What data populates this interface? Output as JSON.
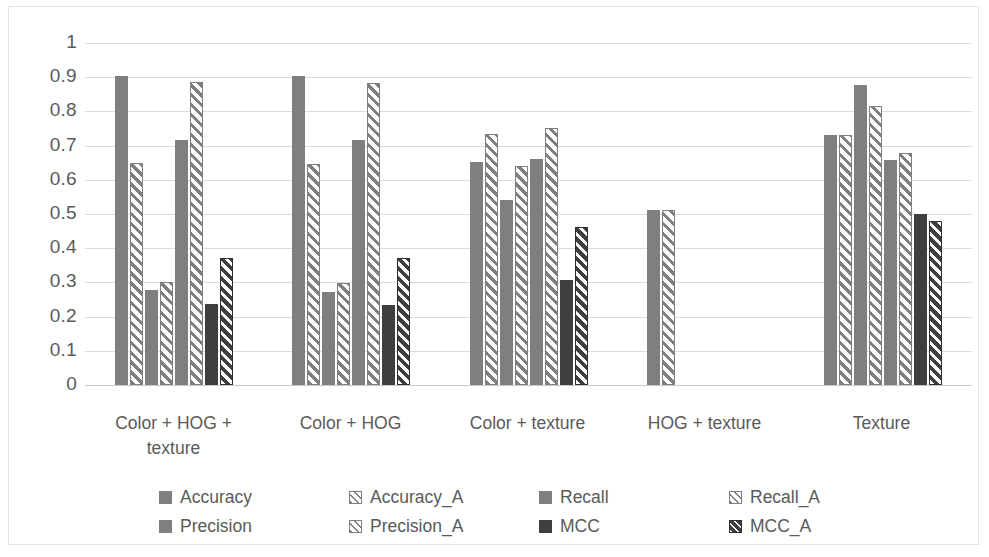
{
  "chart_data": {
    "type": "bar",
    "title": "",
    "xlabel": "",
    "ylabel": "",
    "ylim": [
      0,
      1
    ],
    "ytick_labels": [
      "1",
      "0.9",
      "0.8",
      "0.7",
      "0.6",
      "0.5",
      "0.4",
      "0.3",
      "0.2",
      "0.1",
      "0"
    ],
    "yticks": [
      1,
      0.9,
      0.8,
      0.7,
      0.6,
      0.5,
      0.4,
      0.3,
      0.2,
      0.1,
      0
    ],
    "grid": true,
    "legend_position": "bottom",
    "categories": [
      "Color + HOG + texture",
      "Color + HOG",
      "Color + texture",
      "HOG  + texture",
      "Texture"
    ],
    "category_lines": [
      [
        "Color + HOG +",
        "texture"
      ],
      [
        "Color + HOG"
      ],
      [
        "Color + texture"
      ],
      [
        "HOG  + texture"
      ],
      [
        "Texture"
      ]
    ],
    "series": [
      {
        "name": "Accuracy",
        "style": "solid-gray",
        "values": [
          0.905,
          0.905,
          0.653,
          0.512,
          0.732
        ]
      },
      {
        "name": "Accuracy_A",
        "style": "hatch-gray",
        "values": [
          0.648,
          0.645,
          0.735,
          0.512,
          0.732
        ]
      },
      {
        "name": "Recall",
        "style": "solid-gray",
        "values": [
          0.277,
          0.272,
          0.54,
          null,
          0.877
        ]
      },
      {
        "name": "Recall_A",
        "style": "hatch-gray",
        "values": [
          0.3,
          0.298,
          0.64,
          null,
          0.817
        ]
      },
      {
        "name": "Precision",
        "style": "solid-gray",
        "values": [
          0.717,
          0.715,
          0.662,
          null,
          0.657
        ]
      },
      {
        "name": "Precision_A",
        "style": "hatch-gray",
        "values": [
          0.885,
          0.883,
          0.752,
          null,
          0.678
        ]
      },
      {
        "name": "MCC",
        "style": "solid-dark",
        "values": [
          0.237,
          0.235,
          0.307,
          null,
          0.5
        ]
      },
      {
        "name": "MCC_A",
        "style": "hatch-dark",
        "values": [
          0.372,
          0.37,
          0.462,
          null,
          0.479
        ]
      }
    ]
  },
  "legend": {
    "items": [
      {
        "label": "Accuracy",
        "style": "solid-gray"
      },
      {
        "label": "Accuracy_A",
        "style": "hatch-gray"
      },
      {
        "label": "Recall",
        "style": "solid-gray"
      },
      {
        "label": "Recall_A",
        "style": "hatch-gray"
      },
      {
        "label": "Precision",
        "style": "solid-gray"
      },
      {
        "label": "Precision_A",
        "style": "hatch-gray"
      },
      {
        "label": "MCC",
        "style": "solid-dark"
      },
      {
        "label": "MCC_A",
        "style": "hatch-dark"
      }
    ]
  },
  "colors": {
    "series_gray": "#7f7f7f",
    "series_dark": "#3f3f3f",
    "gridline": "#dcdcdc",
    "text": "#5a5a5a",
    "border": "#e2e2e2",
    "background": "#ffffff"
  }
}
